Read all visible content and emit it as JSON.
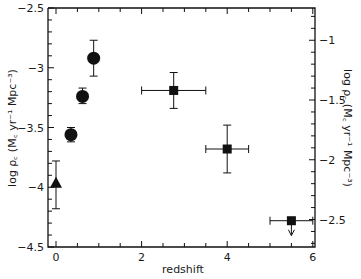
{
  "chart_data": {
    "type": "scatter",
    "title": "",
    "xlabel": "redshift",
    "ylabel": "log ρ꜀ (M꜀ yr⁻¹ Mpc⁻³)",
    "ylabel_right": "log ρ꜀ (M꜀ yr⁻¹ Mpc⁻³)",
    "xlim": [
      0,
      6
    ],
    "ylim": [
      -4.5,
      -2.5
    ],
    "ylim_right": [
      -2.73,
      -0.73
    ],
    "grid": false,
    "legend": null,
    "x_ticks": [
      0,
      2,
      4,
      6
    ],
    "x_tick_labels": [
      "0",
      "2",
      "4",
      "6"
    ],
    "y_ticks": [
      -2.5,
      -3,
      -3.5,
      -4,
      -4.5
    ],
    "y_tick_labels": [
      "-2.5",
      "-3",
      "-3.5",
      "-4",
      "-4.5"
    ],
    "y_right_ticks": [
      -1,
      -1.5,
      -2,
      -2.5
    ],
    "y_right_tick_labels": [
      "-1",
      "-1.5",
      "-2",
      "-2.5"
    ],
    "series": [
      {
        "name": "triangle",
        "marker": "triangle",
        "points": [
          {
            "x": 0.0,
            "y": -3.97,
            "yerr_low": -4.18,
            "yerr_high": -3.78
          }
        ]
      },
      {
        "name": "circles",
        "marker": "circle",
        "points": [
          {
            "x": 0.35,
            "y": -3.56,
            "yerr_low": -3.62,
            "yerr_high": -3.5
          },
          {
            "x": 0.62,
            "y": -3.24,
            "yerr_low": -3.3,
            "yerr_high": -3.17
          },
          {
            "x": 0.88,
            "y": -2.92,
            "yerr_low": -3.07,
            "yerr_high": -2.77
          }
        ]
      },
      {
        "name": "squares",
        "marker": "square",
        "points": [
          {
            "x": 2.75,
            "y": -3.19,
            "xerr_low": 2.0,
            "xerr_high": 3.5,
            "yerr_low": -3.34,
            "yerr_high": -3.04
          },
          {
            "x": 4.0,
            "y": -3.68,
            "xerr_low": 3.5,
            "xerr_high": 4.5,
            "yerr_low": -3.88,
            "yerr_high": -3.48
          },
          {
            "x": 5.5,
            "y": -4.28,
            "xerr_low": 5.0,
            "xerr_high": 6.0,
            "upper_limit": true
          }
        ]
      }
    ]
  }
}
